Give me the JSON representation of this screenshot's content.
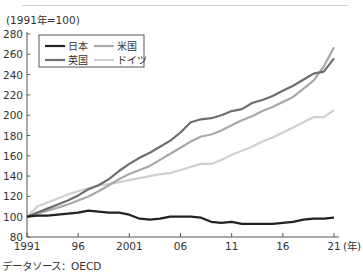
{
  "chart_data": {
    "type": "line",
    "title": "",
    "unit_note": "(1991年=100)",
    "xlabel": "(年)",
    "ylabel": "",
    "ylim": [
      80,
      280
    ],
    "yticks": [
      80,
      100,
      120,
      140,
      160,
      180,
      200,
      220,
      240,
      260,
      280
    ],
    "xticks": [
      1991,
      1996,
      2001,
      2006,
      2011,
      2016,
      2021
    ],
    "xtick_labels": [
      "1991",
      "96",
      "2001",
      "06",
      "11",
      "16",
      "21"
    ],
    "x": [
      1991,
      1992,
      1993,
      1994,
      1995,
      1996,
      1997,
      1998,
      1999,
      2000,
      2001,
      2002,
      2003,
      2004,
      2005,
      2006,
      2007,
      2008,
      2009,
      2010,
      2011,
      2012,
      2013,
      2014,
      2015,
      2016,
      2017,
      2018,
      2019,
      2020,
      2021
    ],
    "series": [
      {
        "name": "日本",
        "color": "#222222",
        "values": [
          100,
          101,
          101,
          102,
          103,
          104,
          106,
          105,
          104,
          104,
          102,
          98,
          97,
          98,
          100,
          100,
          100,
          99,
          95,
          94,
          95,
          93,
          93,
          93,
          93,
          94,
          95,
          97,
          98,
          98,
          99
        ]
      },
      {
        "name": "米国",
        "color": "#a8a8a8",
        "values": [
          100,
          103,
          106,
          109,
          112,
          116,
          120,
          125,
          131,
          137,
          142,
          146,
          150,
          156,
          162,
          168,
          174,
          179,
          181,
          185,
          190,
          195,
          199,
          204,
          208,
          213,
          218,
          226,
          234,
          248,
          267
        ]
      },
      {
        "name": "英国",
        "color": "#6e6e6e",
        "values": [
          100,
          104,
          108,
          112,
          116,
          121,
          127,
          131,
          137,
          145,
          152,
          158,
          163,
          169,
          175,
          183,
          193,
          196,
          197,
          200,
          204,
          206,
          212,
          215,
          219,
          224,
          229,
          235,
          241,
          243,
          256
        ]
      },
      {
        "name": "ドイツ",
        "color": "#d0d0d0",
        "values": [
          100,
          110,
          114,
          118,
          122,
          125,
          128,
          131,
          132,
          134,
          136,
          138,
          140,
          142,
          143,
          146,
          149,
          152,
          152,
          156,
          161,
          165,
          169,
          174,
          178,
          183,
          188,
          193,
          198,
          198,
          205
        ]
      }
    ],
    "legend_position": "upper-left",
    "grid": false
  },
  "header": {
    "unit_note": "(1991年=100)"
  },
  "footer": {
    "source": "データソース：OECD"
  },
  "axis": {
    "y_labels": [
      "280",
      "260",
      "240",
      "220",
      "200",
      "180",
      "160",
      "140",
      "120",
      "100",
      "80"
    ],
    "x_labels": [
      "1991",
      "96",
      "2001",
      "06",
      "11",
      "16",
      "21"
    ],
    "x_unit": "(年)"
  },
  "legend": [
    {
      "label": "日本",
      "color": "#222222"
    },
    {
      "label": "米国",
      "color": "#a8a8a8"
    },
    {
      "label": "英国",
      "color": "#6e6e6e"
    },
    {
      "label": "ドイツ",
      "color": "#d0d0d0"
    }
  ]
}
